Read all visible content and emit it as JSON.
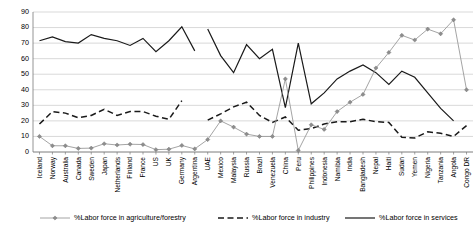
{
  "chart_data": {
    "type": "line",
    "title": "",
    "xlabel": "",
    "ylabel": "",
    "ylim": [
      0,
      90
    ],
    "yticks": [
      0,
      10,
      20,
      30,
      40,
      50,
      60,
      70,
      80,
      90
    ],
    "grid": true,
    "legend_position": "bottom",
    "categories": [
      "Iceland",
      "Norway",
      "Australia",
      "Canada",
      "Sweden",
      "Japan",
      "Netherlands",
      "Finland",
      "France",
      "US",
      "UK",
      "Germany",
      "Argentina",
      "UAE",
      "Mexico",
      "Malaysia",
      "Russia",
      "Brazil",
      "Venezuela",
      "China",
      "Peru",
      "Philippines",
      "Indonesia",
      "Namibia",
      "India",
      "Bangladesh",
      "Nepal",
      "Haiti",
      "Sudan",
      "Yemen",
      "Nigeria",
      "Tanzania",
      "Angola",
      "Congo DR"
    ],
    "series": [
      {
        "name": "%Labor force in agriculture/forestry",
        "color": "#8d8d8d",
        "style": "solid-marker",
        "values": [
          10,
          4,
          4,
          2.3,
          2.5,
          5.3,
          4.5,
          5,
          4.8,
          1.5,
          1.8,
          4.2,
          2,
          8,
          20,
          16,
          11.5,
          10,
          10,
          47,
          1,
          17.5,
          14.5,
          26,
          32,
          37,
          54,
          64,
          75,
          72,
          79,
          76,
          85,
          40
        ]
      },
      {
        "name": "%Labor force in industry",
        "color": "#1a1a1a",
        "style": "dashed",
        "values": [
          18,
          26,
          25,
          22,
          23.5,
          27.5,
          23.5,
          26,
          26,
          23,
          21,
          33,
          null,
          null,
          null,
          null,
          null,
          null,
          null,
          null,
          null,
          null,
          null,
          null,
          null,
          null,
          null,
          null,
          null,
          null,
          null,
          null,
          null,
          null
        ]
      },
      {
        "name": "%Labor force in services",
        "color": "#1a1a1a",
        "style": "solid",
        "values": [
          71.5,
          74,
          71,
          70,
          75.5,
          73,
          71.5,
          68.5,
          73,
          64.5,
          71.5,
          80.5,
          65,
          null,
          null,
          null,
          null,
          null,
          null,
          null,
          null,
          null,
          null,
          null,
          null,
          null,
          null,
          null,
          null,
          null,
          null,
          null,
          null,
          null
        ]
      }
    ],
    "series_right": [
      {
        "name": "%Labor force in industry",
        "values": [
          null,
          null,
          null,
          null,
          null,
          null,
          null,
          null,
          null,
          null,
          null,
          null,
          null,
          20.5,
          24.5,
          29,
          32,
          23.5,
          19,
          22.5,
          14,
          15,
          18,
          19.5,
          19.5,
          21,
          19.5,
          19,
          9.5,
          9,
          13,
          12,
          10,
          17
        ]
      },
      {
        "name": "%Labor force in services",
        "values": [
          null,
          null,
          null,
          null,
          null,
          null,
          null,
          null,
          null,
          null,
          null,
          null,
          null,
          79,
          62,
          51,
          69,
          60,
          66,
          28.5,
          70,
          31,
          38,
          47,
          52,
          56,
          51,
          43.5,
          52,
          48,
          38,
          28,
          20,
          null
        ]
      }
    ]
  },
  "legend": {
    "items": [
      {
        "label": "%Labor force in agriculture/forestry",
        "marker": "line-marker"
      },
      {
        "label": "%Labor force in industry",
        "marker": "dashed-line"
      },
      {
        "label": "%Labor force in services",
        "marker": "solid-line"
      }
    ]
  }
}
